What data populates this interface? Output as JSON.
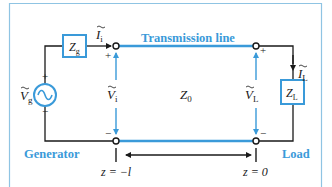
{
  "colors": {
    "accent": "#3a9ad9",
    "frame": "#8fc4e3",
    "wire": "#1a1a1a",
    "line": "#3a9ad9"
  },
  "diagram": {
    "title": "Transmission line",
    "generator": {
      "label": "Generator",
      "source_symbol": "Ṽg",
      "source_base": "V",
      "source_sub": "g",
      "plus": "+",
      "minus": "−",
      "impedance_base": "Z",
      "impedance_sub": "g"
    },
    "input": {
      "current_base": "I",
      "current_sub": "i",
      "voltage_base": "V",
      "voltage_sub": "i",
      "plus": "+",
      "minus": "−"
    },
    "line": {
      "impedance_base": "Z",
      "impedance_sub": "0"
    },
    "load": {
      "label": "Load",
      "current_base": "I",
      "current_sub": "L",
      "voltage_base": "V",
      "voltage_sub": "L",
      "impedance_base": "Z",
      "impedance_sub": "L",
      "plus": "+",
      "minus": "−"
    },
    "axis": {
      "start_label": "z = −l",
      "end_label": "z = 0"
    }
  }
}
